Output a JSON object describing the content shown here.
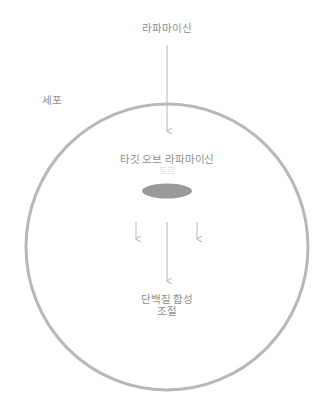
{
  "diagram": {
    "title": "라파마이신",
    "colors": {
      "background": "#ffffff",
      "text": "#8e8e8e",
      "text_faint": "#dcdcdc",
      "cell_membrane": "#b8b8b8",
      "organelle_fill": "#9a9a9a",
      "arrow": "#bdbdbd"
    },
    "labels": {
      "rapamycin": "라파마이신",
      "cell": "세포",
      "tor_main": "타깃 오브 라파마이신",
      "tor_sub": "토르",
      "output_line1": "단백질 합성",
      "output_line2": "조절"
    },
    "shapes": {
      "cell_membrane": {
        "name": "cell-membrane-circle",
        "cx": 167,
        "cy": 247,
        "rx": 141,
        "ry": 143,
        "stroke_width": 3
      },
      "tor_complex": {
        "name": "tor-complex-ellipse",
        "cx": 167,
        "cy": 191,
        "rx": 25,
        "ry": 7.5
      }
    },
    "arrows": [
      {
        "name": "rapamycin-entry-arrow",
        "x": 167,
        "y1": 45,
        "y2": 135,
        "kind": "long-vertical"
      },
      {
        "name": "tor-output-left-arrow",
        "x": 136,
        "y1": 222,
        "y2": 243,
        "kind": "short-vertical"
      },
      {
        "name": "tor-output-center-arrow",
        "x": 167,
        "y1": 222,
        "y2": 285,
        "kind": "long-vertical"
      },
      {
        "name": "tor-output-right-arrow",
        "x": 197,
        "y1": 222,
        "y2": 243,
        "kind": "short-vertical"
      }
    ]
  }
}
